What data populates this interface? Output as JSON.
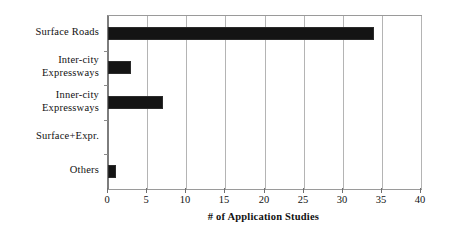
{
  "chart_data": {
    "type": "bar",
    "orientation": "horizontal",
    "title": "",
    "xlabel": "# of Application Studies",
    "ylabel": "",
    "categories": [
      "Surface Roads",
      "Inter-city Expressways",
      "Inner-city Expressways",
      "Surface+Expr.",
      "Others"
    ],
    "category_lines": [
      [
        "Surface Roads"
      ],
      [
        "Inter-city",
        "Expressways"
      ],
      [
        "Inner-city",
        "Expressways"
      ],
      [
        "Surface+Expr."
      ],
      [
        "Others"
      ]
    ],
    "values": [
      34,
      3,
      7,
      0,
      1
    ],
    "xlim": [
      0,
      40
    ],
    "xticks": [
      0,
      5,
      10,
      15,
      20,
      25,
      30,
      35,
      40
    ],
    "xtick_labels": [
      "0",
      "5",
      "10",
      "15",
      "20",
      "25",
      "30",
      "35",
      "40"
    ],
    "grid": true,
    "grid_axis": "x",
    "legend": false,
    "bar_color": "#141414",
    "grid_color": "#b4b4b4",
    "axis_color": "#7d7d7d",
    "background_color": "#ffffff",
    "text_color": "#111111"
  }
}
